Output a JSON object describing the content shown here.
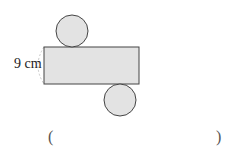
{
  "diagram": {
    "height_label": "9 cm",
    "fill_color": "#e3e3e3",
    "stroke_color": "#444444",
    "dash_color": "#c8c8c8"
  },
  "answer": {
    "open_paren": "(",
    "close_paren": ")",
    "value": ""
  }
}
